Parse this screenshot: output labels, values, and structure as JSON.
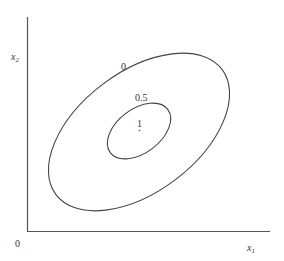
{
  "diagram": {
    "type": "contour-plot",
    "axes": {
      "origin_label": "0",
      "x_label": "x",
      "x_label_sub": "1",
      "y_label": "x",
      "y_label_sub": "2",
      "color": "#555555"
    },
    "contours": [
      {
        "level_label": "0",
        "shape": "ellipse",
        "cx": 139,
        "cy": 132,
        "rx": 104,
        "ry": 60,
        "rotation_deg": -37
      },
      {
        "level_label": "0.5",
        "shape": "ellipse",
        "cx": 139,
        "cy": 131,
        "rx": 36,
        "ry": 22,
        "rotation_deg": -37
      }
    ],
    "peak": {
      "level_label": "1",
      "x": 139,
      "y": 131
    },
    "line_color": "#444444"
  }
}
